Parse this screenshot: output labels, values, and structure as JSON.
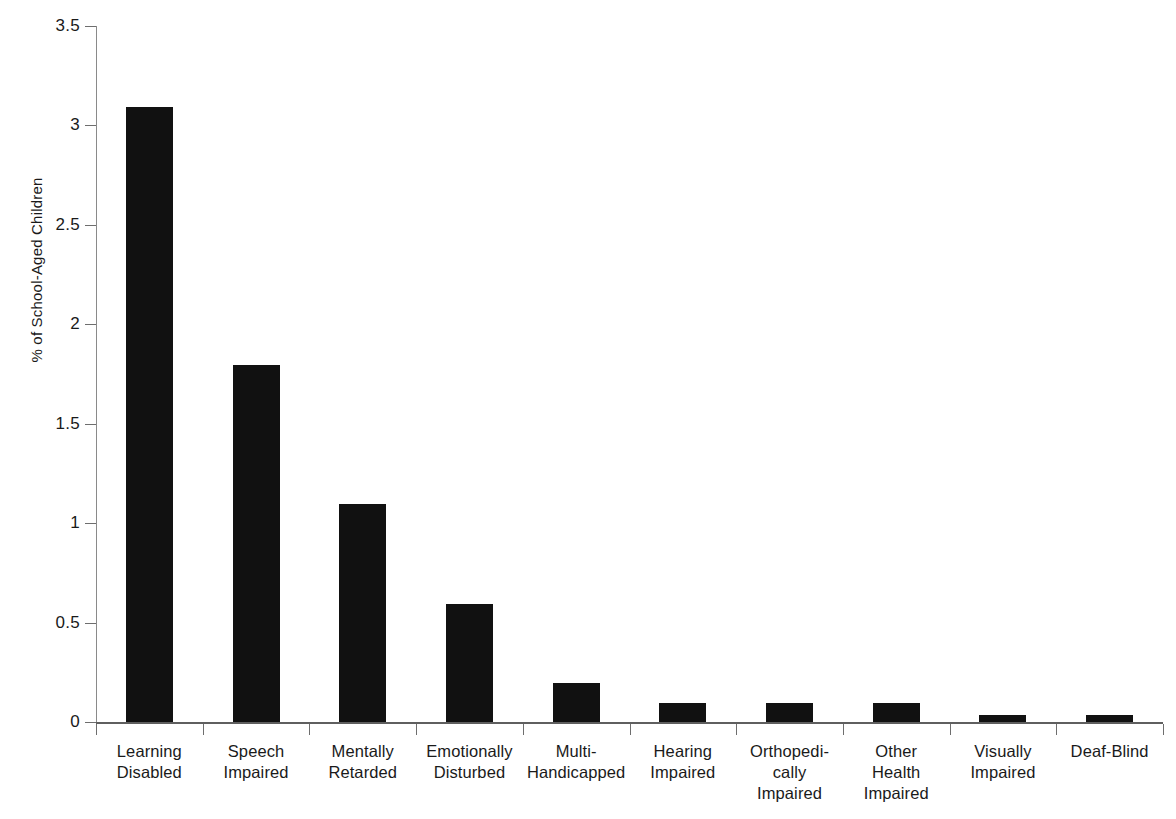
{
  "chart_data": {
    "type": "bar",
    "title": "",
    "subtitle": "",
    "xlabel": "",
    "ylabel": "% of School-Aged Children",
    "ylim": [
      0,
      3.5
    ],
    "ytick_labels": [
      "0",
      "0.5",
      "1",
      "1.5",
      "2",
      "2.5",
      "3",
      "3.5"
    ],
    "ytick_values": [
      0,
      0.5,
      1,
      1.5,
      2,
      2.5,
      3,
      3.5
    ],
    "grid": false,
    "legend": false,
    "bar_color": "#111111",
    "axis_color": "#6e6e6e",
    "categories": [
      "Learning Disabled",
      "Speech Impaired",
      "Mentally Retarded",
      "Emotionally Disturbed",
      "Multi-Handicapped",
      "Hearing Impaired",
      "Orthopedically Impaired",
      "Other Health Impaired",
      "Visually Impaired",
      "Deaf-Blind"
    ],
    "category_label_lines": [
      [
        "Learning",
        "Disabled"
      ],
      [
        "Speech",
        "Impaired"
      ],
      [
        "Mentally",
        "Retarded"
      ],
      [
        "Emotionally",
        "Disturbed"
      ],
      [
        "Multi-",
        "Handicapped"
      ],
      [
        "Hearing",
        "Impaired"
      ],
      [
        "Orthopedi-",
        "cally",
        "Impaired"
      ],
      [
        "Other",
        "Health",
        "Impaired"
      ],
      [
        "Visually",
        "Impaired"
      ],
      [
        "Deaf-Blind"
      ]
    ],
    "values": [
      3.1,
      1.8,
      1.1,
      0.6,
      0.2,
      0.1,
      0.1,
      0.1,
      0.04,
      0.04
    ]
  },
  "caption": {
    "text": ""
  }
}
